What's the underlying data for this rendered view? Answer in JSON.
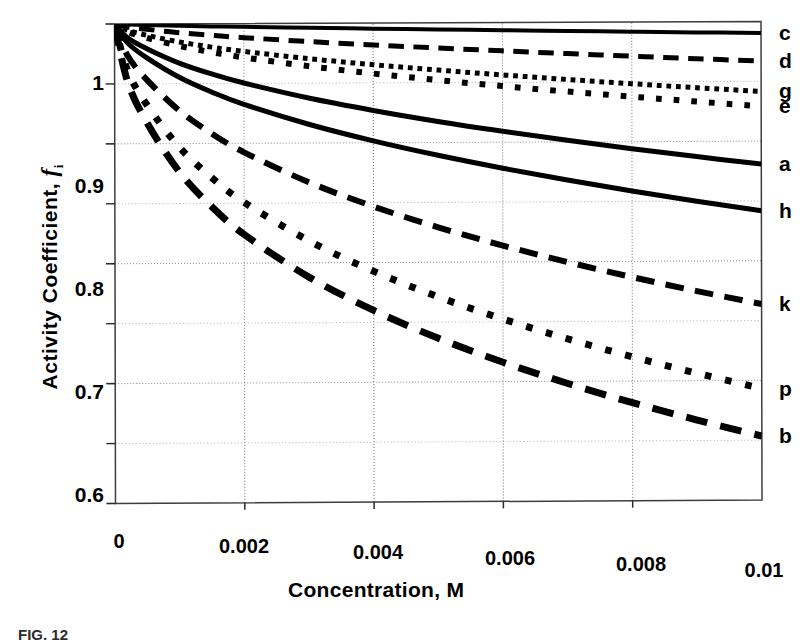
{
  "figure": {
    "caption": "FIG. 12",
    "xlabel": "Concentration, M",
    "ylabel_prefix": "Activity  Coefficient,",
    "ylabel_symbol": "f",
    "ylabel_subscript": "i"
  },
  "chart_data": {
    "type": "line",
    "title": "",
    "xlabel": "Concentration, M",
    "ylabel": "Activity Coefficient, f_i",
    "xlim": [
      0,
      0.01
    ],
    "ylim": [
      0.6,
      1.0
    ],
    "xticks": [
      0,
      0.002,
      0.004,
      0.006,
      0.008,
      0.01
    ],
    "xticklabels": [
      "0",
      "0.002",
      "0.004",
      "0.006",
      "0.008",
      "0.01"
    ],
    "yticks": [
      0.6,
      0.7,
      0.8,
      0.9,
      1.0
    ],
    "yticklabels": [
      "0.6",
      "0.7",
      "0.8",
      "0.9",
      "1"
    ],
    "yminorticks": [
      0.65,
      0.75,
      0.85,
      0.95
    ],
    "grid": true,
    "grid_style": "dotted-minor-and-major",
    "legend_position": "right-of-axes-at-line-end",
    "x": [
      0,
      0.0002,
      0.0005,
      0.001,
      0.0015,
      0.002,
      0.003,
      0.004,
      0.005,
      0.006,
      0.007,
      0.008,
      0.009,
      0.01
    ],
    "series": [
      {
        "name": "c",
        "label": "c",
        "linestyle": "solid",
        "linewidth": 4,
        "values": [
          1.0,
          0.9995,
          0.999,
          0.9983,
          0.9977,
          0.9972,
          0.9962,
          0.9953,
          0.9944,
          0.9935,
          0.9927,
          0.9919,
          0.9911,
          0.9904
        ]
      },
      {
        "name": "d",
        "label": "d",
        "linestyle": "dashed",
        "linewidth": 5,
        "values": [
          1.0,
          0.9975,
          0.9955,
          0.9925,
          0.9902,
          0.9882,
          0.9847,
          0.9817,
          0.9789,
          0.9763,
          0.9738,
          0.9714,
          0.9691,
          0.9669
        ]
      },
      {
        "name": "g",
        "label": "g",
        "linestyle": "dotted-fine",
        "linewidth": 5,
        "values": [
          1.0,
          0.9948,
          0.9905,
          0.9848,
          0.9804,
          0.9767,
          0.9705,
          0.9652,
          0.9605,
          0.9562,
          0.9522,
          0.9484,
          0.9449,
          0.9415
        ]
      },
      {
        "name": "e",
        "label": "e",
        "linestyle": "dotted-coarse",
        "linewidth": 6,
        "values": [
          1.0,
          0.9936,
          0.9884,
          0.9815,
          0.9762,
          0.9717,
          0.9642,
          0.9578,
          0.9521,
          0.9469,
          0.9421,
          0.9376,
          0.9333,
          0.9292
        ]
      },
      {
        "name": "a",
        "label": "a",
        "linestyle": "solid",
        "linewidth": 5,
        "values": [
          1.0,
          0.9885,
          0.9793,
          0.9672,
          0.958,
          0.9503,
          0.9376,
          0.927,
          0.9176,
          0.9092,
          0.9014,
          0.8941,
          0.8873,
          0.8808
        ]
      },
      {
        "name": "h",
        "label": "h",
        "linestyle": "solid",
        "linewidth": 5,
        "values": [
          1.0,
          0.9842,
          0.9716,
          0.9553,
          0.9429,
          0.9325,
          0.9157,
          0.9016,
          0.8893,
          0.8783,
          0.8682,
          0.8588,
          0.85,
          0.8418
        ]
      },
      {
        "name": "k",
        "label": "k",
        "linestyle": "dashed",
        "linewidth": 6,
        "values": [
          1.0,
          0.9737,
          0.9533,
          0.9275,
          0.9083,
          0.8925,
          0.8673,
          0.8468,
          0.8292,
          0.8137,
          0.7997,
          0.7868,
          0.7749,
          0.7638
        ]
      },
      {
        "name": "p",
        "label": "p",
        "linestyle": "dotted-coarse",
        "linewidth": 7,
        "values": [
          1.0,
          0.9612,
          0.9323,
          0.8969,
          0.8714,
          0.8507,
          0.8184,
          0.7927,
          0.7711,
          0.7523,
          0.7355,
          0.7202,
          0.7062,
          0.6932
        ]
      },
      {
        "name": "b",
        "label": "b",
        "linestyle": "dashed",
        "linewidth": 7,
        "values": [
          1.0,
          0.952,
          0.9175,
          0.8763,
          0.8472,
          0.8239,
          0.7881,
          0.76,
          0.7365,
          0.7162,
          0.6982,
          0.6819,
          0.6671,
          0.6534
        ]
      }
    ]
  },
  "axes_labels": {
    "y": [
      "1",
      "0.9",
      "0.8",
      "0.7",
      "0.6"
    ],
    "x": [
      "0",
      "0.002",
      "0.004",
      "0.006",
      "0.008",
      "0.01"
    ]
  },
  "colors": {
    "ink": "#000000",
    "grid": "#9a9a9a",
    "frame": "#4a4a4a"
  }
}
